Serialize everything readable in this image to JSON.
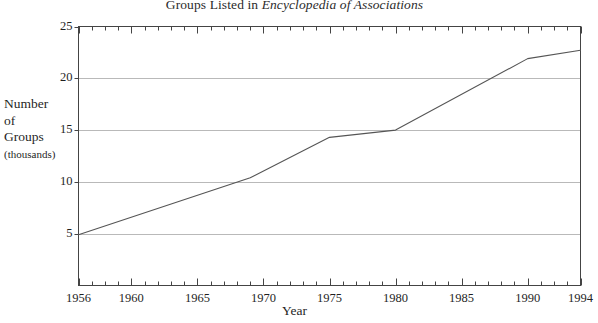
{
  "figure": {
    "title_main": "Groups Listed in ",
    "title_italic": "Encyclopedia of Associations",
    "axis_title_y_line1": "Number",
    "axis_title_y_line2": "of",
    "axis_title_y_line3": "Groups",
    "axis_title_y_line4": "(thousands)",
    "axis_title_x": "Year",
    "line_color": "#555555",
    "grid_color": "#b9b9b9",
    "axis_color": "#444444",
    "background": "#ffffff"
  },
  "chart_data": {
    "type": "line",
    "title": "Groups Listed in Encyclopedia of Associations",
    "xlabel": "Year",
    "ylabel": "Number of Groups (thousands)",
    "xlim": [
      1956,
      1994
    ],
    "ylim": [
      0,
      25
    ],
    "grid": "horizontal",
    "legend": "none",
    "ytick_labels": [
      "25",
      "20",
      "15",
      "10",
      "5"
    ],
    "ytick_values": [
      25,
      20,
      15,
      10,
      5
    ],
    "xtick_labels": [
      "1956",
      "1960",
      "1965",
      "1970",
      "1975",
      "1980",
      "1985",
      "1990",
      "1994"
    ],
    "xtick_values": [
      1956,
      1960,
      1965,
      1970,
      1975,
      1980,
      1985,
      1990,
      1994
    ],
    "x_minor_tick_interval": 1,
    "series": [
      {
        "name": "Groups listed",
        "x": [
          1956,
          1969,
          1975,
          1980,
          1990,
          1994
        ],
        "values": [
          4.9,
          10.4,
          14.3,
          15.0,
          21.9,
          22.7
        ]
      }
    ]
  }
}
